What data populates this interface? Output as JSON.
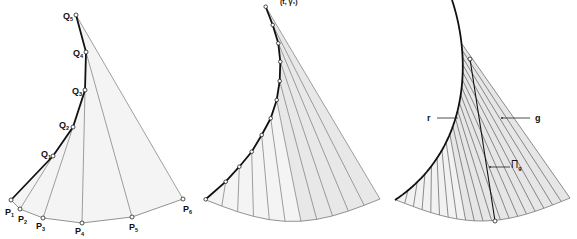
{
  "figure": {
    "header_fragment": "(t, γ₁)",
    "fill_color_light": "#f3f3f3",
    "fill_color_mid": "#e4e4e4",
    "curve_color": "#111111",
    "ruling_color": "#777777"
  },
  "panel1": {
    "q_labels": [
      {
        "main": "Q",
        "sub": "1"
      },
      {
        "main": "Q",
        "sub": "2"
      },
      {
        "main": "Q",
        "sub": "3"
      },
      {
        "main": "Q",
        "sub": "4"
      },
      {
        "main": "Q",
        "sub": "5"
      }
    ],
    "p_labels": [
      {
        "main": "P",
        "sub": "1"
      },
      {
        "main": "P",
        "sub": "2"
      },
      {
        "main": "P",
        "sub": "3"
      },
      {
        "main": "P",
        "sub": "4"
      },
      {
        "main": "P",
        "sub": "5"
      },
      {
        "main": "P",
        "sub": "6"
      }
    ]
  },
  "panel2": {
    "subdivision_points": 12
  },
  "panel3": {
    "label_r": "r",
    "label_g": "g",
    "label_pi": "Π",
    "label_pi_sub": "g"
  }
}
